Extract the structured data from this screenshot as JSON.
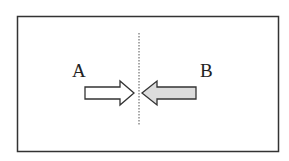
{
  "diagram": {
    "frame": {
      "x": 17,
      "y": 16,
      "width": 261,
      "height": 135,
      "stroke": "#333333"
    },
    "divider": {
      "x": 139,
      "y1": 33,
      "y2": 125,
      "style": "dotted",
      "stroke": "#555555"
    },
    "labels": {
      "a": "A",
      "b": "B"
    },
    "arrows": [
      {
        "id": "A",
        "direction": "right",
        "fill": "#ffffff",
        "stroke": "#333333",
        "points": "85,87 120,87 120,81 134,93 120,105 120,99 85,99"
      },
      {
        "id": "B",
        "direction": "left",
        "fill": "#dcdcdc",
        "stroke": "#333333",
        "points": "196,87 157,87 157,81 142,93 157,105 157,99 196,99"
      }
    ]
  }
}
